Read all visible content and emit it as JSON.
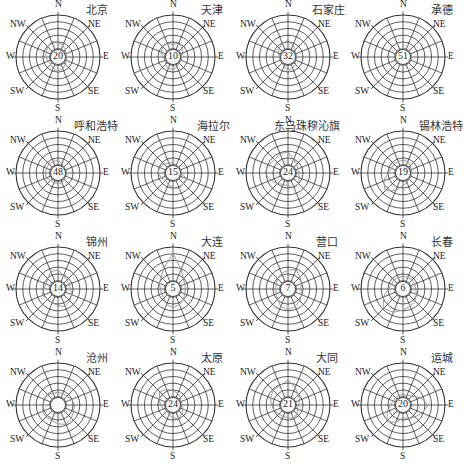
{
  "figure": {
    "title": "",
    "directions": [
      "N",
      "NE",
      "E",
      "SE",
      "S",
      "SW",
      "W",
      "NW"
    ],
    "colors": {
      "grid": "#333333",
      "rose": "#9a9a9a",
      "text": "#222222"
    }
  },
  "chart_data": {
    "type": "wind_rose",
    "title": "",
    "rings": 6,
    "spokes": 16,
    "direction_labels": [
      "N",
      "NE",
      "E",
      "SE",
      "S",
      "SW",
      "W",
      "NW"
    ],
    "center_value_meaning": "calm frequency (%)",
    "stations": [
      {
        "name": "北京",
        "calm": "20"
      },
      {
        "name": "天津",
        "calm": "10"
      },
      {
        "name": "石家庄",
        "calm": "32"
      },
      {
        "name": "承德",
        "calm": "51"
      },
      {
        "name": "呼和浩特",
        "calm": "48"
      },
      {
        "name": "海拉尔",
        "calm": "15"
      },
      {
        "name": "东乌珠穆沁旗",
        "calm": "24"
      },
      {
        "name": "锡林浩特",
        "calm": "19"
      },
      {
        "name": "锦州",
        "calm": "14"
      },
      {
        "name": "大连",
        "calm": "5"
      },
      {
        "name": "营口",
        "calm": "7"
      },
      {
        "name": "长春",
        "calm": "6"
      },
      {
        "name": "沧州",
        "calm": ""
      },
      {
        "name": "太原",
        "calm": "24"
      },
      {
        "name": "大同",
        "calm": "21"
      },
      {
        "name": "运城",
        "calm": "20"
      }
    ]
  },
  "panels": [
    {
      "city": "北京",
      "calm": "20"
    },
    {
      "city": "天津",
      "calm": "10"
    },
    {
      "city": "石家庄",
      "calm": "32"
    },
    {
      "city": "承德",
      "calm": "51"
    },
    {
      "city": "呼和浩特",
      "calm": "48"
    },
    {
      "city": "海拉尔",
      "calm": "15"
    },
    {
      "city": "东乌珠穆沁旗",
      "calm": "24"
    },
    {
      "city": "锡林浩特",
      "calm": "19"
    },
    {
      "city": "锦州",
      "calm": "14"
    },
    {
      "city": "大连",
      "calm": "5"
    },
    {
      "city": "营口",
      "calm": "7"
    },
    {
      "city": "长春",
      "calm": "6"
    },
    {
      "city": "沧州",
      "calm": ""
    },
    {
      "city": "太原",
      "calm": "24"
    },
    {
      "city": "大同",
      "calm": "21"
    },
    {
      "city": "运城",
      "calm": "20"
    }
  ]
}
